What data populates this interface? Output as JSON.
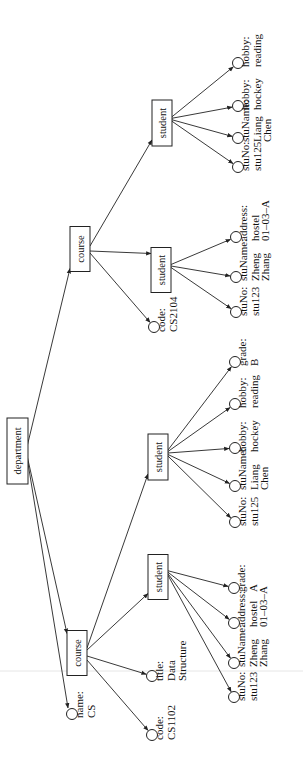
{
  "diagram": {
    "root": {
      "label": "department",
      "attribute": {
        "key": "name:",
        "value": "CS"
      },
      "courses": [
        {
          "label": "course",
          "code": {
            "key": "code:",
            "value": "CS1102"
          },
          "title": {
            "key": "title:",
            "value_line1": "Data",
            "value_line2": "Structure"
          },
          "students": [
            {
              "label": "student",
              "fields": [
                {
                  "key": "stuNo:",
                  "line1": "stu123",
                  "line2": ""
                },
                {
                  "key": "stuName:",
                  "line1": "Zheng",
                  "line2": "Zhang"
                },
                {
                  "key": "address:",
                  "line1": "hostel",
                  "line2": "01–03–A"
                },
                {
                  "key": "grade:",
                  "line1": "A",
                  "line2": ""
                }
              ]
            },
            {
              "label": "student",
              "fields": [
                {
                  "key": "stuNo:",
                  "line1": "stu125",
                  "line2": ""
                },
                {
                  "key": "stuName:",
                  "line1": "Liang",
                  "line2": "Chen"
                },
                {
                  "key": "hobby:",
                  "line1": "hockey",
                  "line2": ""
                },
                {
                  "key": "hobby:",
                  "line1": "reading",
                  "line2": ""
                },
                {
                  "key": "grade:",
                  "line1": "B",
                  "line2": ""
                }
              ]
            }
          ]
        },
        {
          "label": "course",
          "code": {
            "key": "code:",
            "value": "CS2104"
          },
          "students": [
            {
              "label": "student",
              "fields": [
                {
                  "key": "stuNo:",
                  "line1": "stu123",
                  "line2": ""
                },
                {
                  "key": "stuName:",
                  "line1": "Zheng",
                  "line2": "Zhang"
                },
                {
                  "key": "address:",
                  "line1": "hostel",
                  "line2": "01–03–A"
                }
              ]
            },
            {
              "label": "student",
              "fields": [
                {
                  "key": "stuNo:",
                  "line1": "stu125",
                  "line2": ""
                },
                {
                  "key": "stuName:",
                  "line1": "Liang",
                  "line2": "Chen"
                },
                {
                  "key": "hobby:",
                  "line1": "hockey",
                  "line2": ""
                },
                {
                  "key": "hobby:",
                  "line1": "reading",
                  "line2": ""
                }
              ]
            }
          ]
        }
      ]
    }
  }
}
